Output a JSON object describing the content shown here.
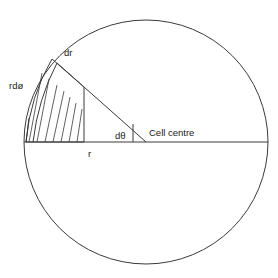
{
  "figure": {
    "type": "geometric-diagram",
    "background_color": "#ffffff",
    "stroke_color": "#3a3a3a",
    "text_color": "#1a1a1a"
  },
  "geometry": {
    "circle": {
      "center_x": 146,
      "center_y": 142,
      "radius": 122
    },
    "horizontal_radius": {
      "x1": 24,
      "y1": 142,
      "x2": 268,
      "y2": 142
    },
    "slanted_radius": {
      "x1": 146,
      "y1": 142,
      "x2": 57,
      "y2": 63
    },
    "angle_tick": {
      "x": 133,
      "y_top": 124,
      "y_bottom": 142
    },
    "element": {
      "inner_x": 26,
      "inner_y": 142,
      "hatch_count": 7,
      "dr_line": {
        "x1": 52,
        "y1": 59,
        "x2": 84,
        "y2": 87
      }
    }
  },
  "labels": {
    "arc_element": "rdø",
    "radial_element": "dr",
    "angle_element": "dθ",
    "centre": "Cell centre",
    "radius": "r"
  }
}
